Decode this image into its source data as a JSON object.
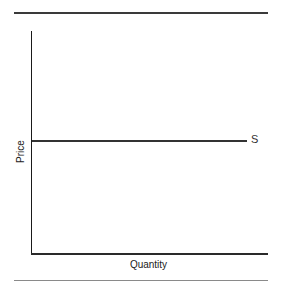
{
  "diagram": {
    "type": "supply-curve",
    "x_axis_label": "Quantity",
    "y_axis_label": "Price",
    "curves": [
      {
        "label": "S",
        "shape": "horizontal",
        "color": "#333333"
      }
    ]
  },
  "colors": {
    "axis": "#1a1a1a",
    "curve": "#333333",
    "rule": "#3a3a3a"
  }
}
